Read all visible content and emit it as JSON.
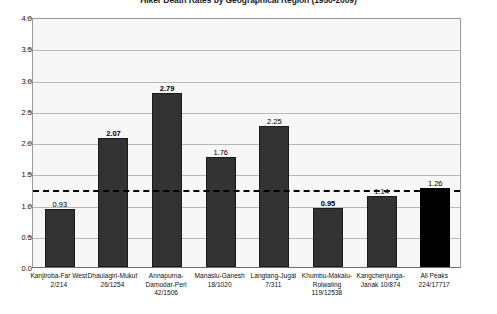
{
  "chart_data": {
    "type": "bar",
    "title": "Hiker Death Rates by Geographical Region (1950-2009)",
    "xlabel": "",
    "ylabel": "",
    "ylim": [
      0,
      4.0
    ],
    "ytick_labels": [
      "0.5",
      "1.0",
      "1.5",
      "2.0",
      "2.5",
      "3.0",
      "3.5",
      "4.0"
    ],
    "ytick_values": [
      0.5,
      1.0,
      1.5,
      2.0,
      2.5,
      3.0,
      3.5,
      4.0
    ],
    "grid": true,
    "legend": "none",
    "categories": [
      "Kanjiroba-Far West",
      "Dhaulagiri-Mukut",
      "Annapurna-Damodar-Peri",
      "Manaslu-Ganesh",
      "Langtang-Jugal",
      "Khumbu-Makalu-Rolwaling",
      "Kangchenjunga-Janak",
      "All Peaks"
    ],
    "category_lines": [
      [
        "Kanjiroba-Far West"
      ],
      [
        "Dhaulagiri-Mukut"
      ],
      [
        "Annapurna-",
        "Damodar-Peri"
      ],
      [
        "Manaslu-Ganesh"
      ],
      [
        "Langtang-Jugal"
      ],
      [
        "Khumbu-Makalu-",
        "Rolwaling"
      ],
      [
        "Kangchenjunga-",
        "Janak  10/874"
      ],
      [
        "All Peaks"
      ]
    ],
    "fractions": [
      "2/214",
      "26/1254",
      "42/1506",
      "18/1020",
      "7/311",
      "119/12538",
      "",
      "224/17717"
    ],
    "values": [
      0.93,
      2.07,
      2.79,
      1.76,
      2.25,
      0.95,
      1.14,
      1.26
    ],
    "value_labels": [
      "0.93",
      "2.07",
      "2.79",
      "1.76",
      "2.25",
      "0.95",
      "1.14",
      "1.26"
    ],
    "value_label_bold": [
      false,
      true,
      true,
      false,
      false,
      true,
      false,
      false
    ],
    "bar_styles": [
      "gray",
      "gray",
      "gray",
      "gray",
      "gray",
      "gray",
      "gray",
      "black"
    ],
    "reference_line": {
      "value": 1.26,
      "style": "dashed",
      "color": "#000000"
    },
    "colors": {
      "bar_gray": "#333333",
      "bar_black": "#000000",
      "plot_background": "#f7f7f7",
      "gridline": "#b9b9b9",
      "axis": "#6f6f6f"
    }
  }
}
